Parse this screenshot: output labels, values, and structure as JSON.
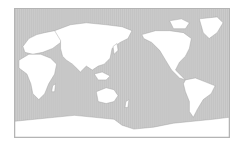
{
  "map": {
    "title": "World map (Pacific-centered)",
    "projection": "equirectangular",
    "center_longitude": 150,
    "colors": {
      "ocean": "#c9c9c9",
      "land": "#ffffff",
      "coastline": "#8a8a8a",
      "frame": "#b4b4b4"
    },
    "regions": [
      "Africa",
      "Europe",
      "Asia",
      "Australia",
      "North America",
      "Greenland",
      "South America",
      "Antarctica"
    ]
  }
}
